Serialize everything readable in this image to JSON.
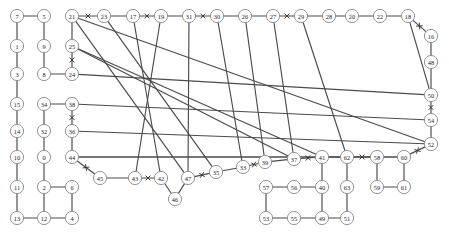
{
  "diagram": {
    "type": "graph",
    "width": 449,
    "height": 236,
    "background_color": "#ffffff",
    "node_style": {
      "radius": 6.6,
      "fill": "#ffffff",
      "stroke": "#8d8d8d",
      "label_color": "#1a1a1a"
    },
    "edge_style": {
      "stroke": "#4a4a4a",
      "width": 1.15
    },
    "cross_marker_style": {
      "stroke": "#3a3a3a",
      "width": 1.0,
      "size": 4.2
    },
    "nodes": [
      {
        "id": "7",
        "label": "7",
        "x": 17,
        "y": 16
      },
      {
        "id": "5",
        "label": "5",
        "x": 44,
        "y": 16
      },
      {
        "id": "1",
        "label": "1",
        "x": 17,
        "y": 46
      },
      {
        "id": "9",
        "label": "9",
        "x": 44,
        "y": 46
      },
      {
        "id": "3",
        "label": "3",
        "x": 17,
        "y": 74
      },
      {
        "id": "8",
        "label": "8",
        "x": 44,
        "y": 74
      },
      {
        "id": "15",
        "label": "15",
        "x": 17,
        "y": 104
      },
      {
        "id": "14",
        "label": "14",
        "x": 17,
        "y": 131
      },
      {
        "id": "10",
        "label": "10",
        "x": 17,
        "y": 157
      },
      {
        "id": "11",
        "label": "11",
        "x": 17,
        "y": 187
      },
      {
        "id": "13",
        "label": "13",
        "x": 17,
        "y": 218
      },
      {
        "id": "34",
        "label": "34",
        "x": 44,
        "y": 104
      },
      {
        "id": "32",
        "label": "32",
        "x": 44,
        "y": 131
      },
      {
        "id": "0",
        "label": "0",
        "x": 44,
        "y": 157
      },
      {
        "id": "2",
        "label": "2",
        "x": 44,
        "y": 187
      },
      {
        "id": "12",
        "label": "12",
        "x": 44,
        "y": 218
      },
      {
        "id": "6",
        "label": "6",
        "x": 72,
        "y": 187
      },
      {
        "id": "4",
        "label": "4",
        "x": 72,
        "y": 218
      },
      {
        "id": "21",
        "label": "21",
        "x": 72,
        "y": 16
      },
      {
        "id": "25",
        "label": "25",
        "x": 72,
        "y": 46
      },
      {
        "id": "24",
        "label": "24",
        "x": 72,
        "y": 74
      },
      {
        "id": "38",
        "label": "38",
        "x": 72,
        "y": 104
      },
      {
        "id": "36",
        "label": "36",
        "x": 72,
        "y": 131
      },
      {
        "id": "44",
        "label": "44",
        "x": 72,
        "y": 157
      },
      {
        "id": "23",
        "label": "23",
        "x": 104,
        "y": 16
      },
      {
        "id": "17",
        "label": "17",
        "x": 133,
        "y": 16
      },
      {
        "id": "19",
        "label": "19",
        "x": 161,
        "y": 16
      },
      {
        "id": "31",
        "label": "31",
        "x": 189,
        "y": 16
      },
      {
        "id": "30",
        "label": "30",
        "x": 217,
        "y": 16
      },
      {
        "id": "26",
        "label": "26",
        "x": 245,
        "y": 16
      },
      {
        "id": "27",
        "label": "27",
        "x": 273,
        "y": 16
      },
      {
        "id": "29",
        "label": "29",
        "x": 301,
        "y": 16
      },
      {
        "id": "28",
        "label": "28",
        "x": 329,
        "y": 16
      },
      {
        "id": "20",
        "label": "20",
        "x": 352,
        "y": 16
      },
      {
        "id": "22",
        "label": "22",
        "x": 380,
        "y": 16
      },
      {
        "id": "18",
        "label": "18",
        "x": 408,
        "y": 16
      },
      {
        "id": "16",
        "label": "16",
        "x": 431,
        "y": 36
      },
      {
        "id": "48",
        "label": "48",
        "x": 431,
        "y": 62
      },
      {
        "id": "50",
        "label": "50",
        "x": 431,
        "y": 95
      },
      {
        "id": "54",
        "label": "54",
        "x": 431,
        "y": 120
      },
      {
        "id": "52",
        "label": "52",
        "x": 431,
        "y": 144
      },
      {
        "id": "45",
        "label": "45",
        "x": 100,
        "y": 178
      },
      {
        "id": "43",
        "label": "43",
        "x": 135,
        "y": 178
      },
      {
        "id": "42",
        "label": "42",
        "x": 161,
        "y": 178
      },
      {
        "id": "46",
        "label": "46",
        "x": 175,
        "y": 199
      },
      {
        "id": "47",
        "label": "47",
        "x": 188,
        "y": 178
      },
      {
        "id": "35",
        "label": "35",
        "x": 216,
        "y": 172
      },
      {
        "id": "33",
        "label": "33",
        "x": 243,
        "y": 167
      },
      {
        "id": "39",
        "label": "39",
        "x": 265,
        "y": 162
      },
      {
        "id": "37",
        "label": "37",
        "x": 294,
        "y": 159
      },
      {
        "id": "41",
        "label": "41",
        "x": 322,
        "y": 157
      },
      {
        "id": "62",
        "label": "62",
        "x": 347,
        "y": 157
      },
      {
        "id": "58",
        "label": "58",
        "x": 377,
        "y": 157
      },
      {
        "id": "60",
        "label": "60",
        "x": 404,
        "y": 157
      },
      {
        "id": "57",
        "label": "57",
        "x": 266,
        "y": 187
      },
      {
        "id": "56",
        "label": "56",
        "x": 294,
        "y": 187
      },
      {
        "id": "40",
        "label": "40",
        "x": 322,
        "y": 187
      },
      {
        "id": "63",
        "label": "63",
        "x": 347,
        "y": 187
      },
      {
        "id": "59",
        "label": "59",
        "x": 377,
        "y": 187
      },
      {
        "id": "61",
        "label": "61",
        "x": 404,
        "y": 187
      },
      {
        "id": "53",
        "label": "53",
        "x": 266,
        "y": 218
      },
      {
        "id": "55",
        "label": "55",
        "x": 294,
        "y": 218
      },
      {
        "id": "49",
        "label": "49",
        "x": 322,
        "y": 218
      },
      {
        "id": "51",
        "label": "51",
        "x": 347,
        "y": 218
      }
    ],
    "edges": [
      {
        "source": "7",
        "target": "5",
        "cross": false
      },
      {
        "source": "7",
        "target": "1",
        "cross": false
      },
      {
        "source": "5",
        "target": "9",
        "cross": false
      },
      {
        "source": "1",
        "target": "3",
        "cross": false
      },
      {
        "source": "9",
        "target": "8",
        "cross": false
      },
      {
        "source": "3",
        "target": "15",
        "cross": false
      },
      {
        "source": "8",
        "target": "24",
        "cross": false
      },
      {
        "source": "15",
        "target": "14",
        "cross": false
      },
      {
        "source": "14",
        "target": "10",
        "cross": false
      },
      {
        "source": "10",
        "target": "11",
        "cross": false
      },
      {
        "source": "11",
        "target": "13",
        "cross": false
      },
      {
        "source": "13",
        "target": "12",
        "cross": false
      },
      {
        "source": "12",
        "target": "2",
        "cross": false
      },
      {
        "source": "12",
        "target": "4",
        "cross": false
      },
      {
        "source": "2",
        "target": "6",
        "cross": false
      },
      {
        "source": "6",
        "target": "4",
        "cross": false
      },
      {
        "source": "34",
        "target": "32",
        "cross": false
      },
      {
        "source": "32",
        "target": "0",
        "cross": false
      },
      {
        "source": "0",
        "target": "2",
        "cross": false
      },
      {
        "source": "34",
        "target": "38",
        "cross": false
      },
      {
        "source": "38",
        "target": "36",
        "cross": true
      },
      {
        "source": "36",
        "target": "44",
        "cross": false
      },
      {
        "source": "44",
        "target": "45",
        "cross": true
      },
      {
        "source": "21",
        "target": "25",
        "cross": false
      },
      {
        "source": "25",
        "target": "24",
        "cross": true
      },
      {
        "source": "21",
        "target": "23",
        "cross": true
      },
      {
        "source": "23",
        "target": "17",
        "cross": false
      },
      {
        "source": "17",
        "target": "19",
        "cross": true
      },
      {
        "source": "19",
        "target": "31",
        "cross": false
      },
      {
        "source": "31",
        "target": "30",
        "cross": true
      },
      {
        "source": "30",
        "target": "26",
        "cross": false
      },
      {
        "source": "26",
        "target": "27",
        "cross": false
      },
      {
        "source": "27",
        "target": "29",
        "cross": true
      },
      {
        "source": "29",
        "target": "28",
        "cross": false
      },
      {
        "source": "28",
        "target": "20",
        "cross": false
      },
      {
        "source": "20",
        "target": "22",
        "cross": false
      },
      {
        "source": "22",
        "target": "18",
        "cross": false
      },
      {
        "source": "18",
        "target": "16",
        "cross": true
      },
      {
        "source": "16",
        "target": "48",
        "cross": false
      },
      {
        "source": "48",
        "target": "50",
        "cross": false
      },
      {
        "source": "50",
        "target": "54",
        "cross": true
      },
      {
        "source": "54",
        "target": "52",
        "cross": false
      },
      {
        "source": "52",
        "target": "60",
        "cross": true
      },
      {
        "source": "60",
        "target": "61",
        "cross": false
      },
      {
        "source": "45",
        "target": "43",
        "cross": false
      },
      {
        "source": "43",
        "target": "42",
        "cross": true
      },
      {
        "source": "42",
        "target": "46",
        "cross": false
      },
      {
        "source": "46",
        "target": "47",
        "cross": false
      },
      {
        "source": "47",
        "target": "35",
        "cross": true
      },
      {
        "source": "35",
        "target": "33",
        "cross": false
      },
      {
        "source": "33",
        "target": "39",
        "cross": true
      },
      {
        "source": "39",
        "target": "37",
        "cross": false
      },
      {
        "source": "37",
        "target": "41",
        "cross": true
      },
      {
        "source": "41",
        "target": "62",
        "cross": false
      },
      {
        "source": "62",
        "target": "58",
        "cross": true
      },
      {
        "source": "58",
        "target": "60",
        "cross": false
      },
      {
        "source": "41",
        "target": "40",
        "cross": false
      },
      {
        "source": "40",
        "target": "56",
        "cross": false
      },
      {
        "source": "56",
        "target": "57",
        "cross": false
      },
      {
        "source": "57",
        "target": "53",
        "cross": false
      },
      {
        "source": "53",
        "target": "55",
        "cross": false
      },
      {
        "source": "55",
        "target": "49",
        "cross": false
      },
      {
        "source": "49",
        "target": "40",
        "cross": false
      },
      {
        "source": "49",
        "target": "51",
        "cross": false
      },
      {
        "source": "51",
        "target": "63",
        "cross": false
      },
      {
        "source": "63",
        "target": "62",
        "cross": false
      },
      {
        "source": "59",
        "target": "58",
        "cross": false
      },
      {
        "source": "59",
        "target": "61",
        "cross": false
      },
      {
        "source": "21",
        "target": "47",
        "cross": false
      },
      {
        "source": "21",
        "target": "52",
        "cross": false
      },
      {
        "source": "25",
        "target": "41",
        "cross": false
      },
      {
        "source": "25",
        "target": "37",
        "cross": false
      },
      {
        "source": "24",
        "target": "50",
        "cross": false
      },
      {
        "source": "38",
        "target": "54",
        "cross": false
      },
      {
        "source": "36",
        "target": "52",
        "cross": false
      },
      {
        "source": "44",
        "target": "60",
        "cross": false
      },
      {
        "source": "44",
        "target": "58",
        "cross": false
      },
      {
        "source": "23",
        "target": "35",
        "cross": false
      },
      {
        "source": "17",
        "target": "42",
        "cross": false
      },
      {
        "source": "19",
        "target": "43",
        "cross": false
      },
      {
        "source": "31",
        "target": "47",
        "cross": false
      },
      {
        "source": "30",
        "target": "33",
        "cross": false
      },
      {
        "source": "26",
        "target": "39",
        "cross": false
      },
      {
        "source": "27",
        "target": "37",
        "cross": false
      },
      {
        "source": "29",
        "target": "62",
        "cross": false
      },
      {
        "source": "18",
        "target": "50",
        "cross": false
      }
    ]
  }
}
